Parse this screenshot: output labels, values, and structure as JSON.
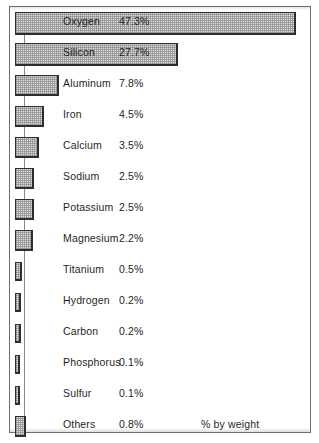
{
  "figure": {
    "unit_note": "% by weight",
    "frame_color": "#6f6f6f",
    "bar_fill": "#dedede",
    "bar_border": "#2e2e2e",
    "text_color": "#1f1f1f"
  },
  "chart_data": {
    "type": "bar",
    "title": "",
    "subtitle": "",
    "xlabel": "% by weight",
    "ylabel": "",
    "orientation": "horizontal",
    "grid": false,
    "legend": false,
    "xlim": [
      0,
      47.3
    ],
    "value_suffix": "%",
    "categories": [
      "Oxygen",
      "Silicon",
      "Aluminum",
      "Iron",
      "Calcium",
      "Sodium",
      "Potassium",
      "Magnesium",
      "Titanium",
      "Hydrogen",
      "Carbon",
      "Phosphorus",
      "Sulfur",
      "Others"
    ],
    "values": [
      47.3,
      27.7,
      7.8,
      4.5,
      3.5,
      2.5,
      2.5,
      2.2,
      0.5,
      0.2,
      0.2,
      0.1,
      0.1,
      0.8
    ],
    "value_labels": [
      "47.3%",
      "27.7%",
      "7.8%",
      "4.5%",
      "3.5%",
      "2.5%",
      "2.5%",
      "2.2%",
      "0.5%",
      "0.2%",
      "0.2%",
      "0.1%",
      "0.1%",
      "0.8%"
    ],
    "bars": [
      {
        "label": "Oxygen",
        "value": 47.3,
        "value_label": "47.3%",
        "bar_px": 281,
        "style": "tall",
        "top": 3
      },
      {
        "label": "Silicon",
        "value": 27.7,
        "value_label": "27.7%",
        "bar_px": 163,
        "style": "tall",
        "top": 34
      },
      {
        "label": "Aluminum",
        "value": 7.8,
        "value_label": "7.8%",
        "bar_px": 44,
        "style": "mid",
        "top": 65
      },
      {
        "label": "Iron",
        "value": 4.5,
        "value_label": "4.5%",
        "bar_px": 29,
        "style": "mid",
        "top": 96
      },
      {
        "label": "Calcium",
        "value": 3.5,
        "value_label": "3.5%",
        "bar_px": 24,
        "style": "mid",
        "top": 127
      },
      {
        "label": "Sodium",
        "value": 2.5,
        "value_label": "2.5%",
        "bar_px": 19,
        "style": "mid",
        "top": 158
      },
      {
        "label": "Potassium",
        "value": 2.5,
        "value_label": "2.5%",
        "bar_px": 19,
        "style": "mid",
        "top": 189
      },
      {
        "label": "Magnesium",
        "value": 2.2,
        "value_label": "2.2%",
        "bar_px": 18,
        "style": "mid",
        "top": 220
      },
      {
        "label": "Titanium",
        "value": 0.5,
        "value_label": "0.5%",
        "bar_px": 7,
        "style": "thin",
        "top": 251
      },
      {
        "label": "Hydrogen",
        "value": 0.2,
        "value_label": "0.2%",
        "bar_px": 6,
        "style": "thin",
        "top": 282
      },
      {
        "label": "Carbon",
        "value": 0.2,
        "value_label": "0.2%",
        "bar_px": 6,
        "style": "thin",
        "top": 313
      },
      {
        "label": "Phosphorus",
        "value": 0.1,
        "value_label": "0.1%",
        "bar_px": 5,
        "style": "thin",
        "top": 344
      },
      {
        "label": "Sulfur",
        "value": 0.1,
        "value_label": "0.1%",
        "bar_px": 5,
        "style": "thin",
        "top": 375
      },
      {
        "label": "Others",
        "value": 0.8,
        "value_label": "0.8%",
        "bar_px": 11,
        "style": "mid",
        "top": 406
      }
    ]
  }
}
